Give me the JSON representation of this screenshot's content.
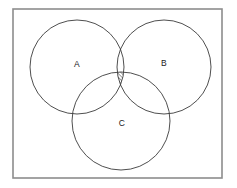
{
  "figure": {
    "background_color": "#ffffff",
    "frame": {
      "name": "universal-set-frame",
      "x": 13,
      "y": 9,
      "width": 209,
      "height": 169,
      "stroke_color": "#8d8d8d",
      "stroke_width": 1.6
    },
    "circle_stroke_color": "#3b3b3b",
    "circle_stroke_width": 0.9,
    "sets": [
      {
        "id": "A",
        "label": "A",
        "cx": 77,
        "cy": 67,
        "r": 47,
        "label_x": 77,
        "label_y": 65
      },
      {
        "id": "B",
        "label": "B",
        "cx": 164,
        "cy": 67,
        "r": 47,
        "label_x": 164,
        "label_y": 64
      },
      {
        "id": "C",
        "label": "C",
        "cx": 121,
        "cy": 121,
        "r": 49,
        "label_x": 122,
        "label_y": 124
      }
    ],
    "shaded_region": {
      "name": "triple-intersection",
      "description": "A intersect B intersect C",
      "fill_pattern": "diagonal-hatch",
      "hatch_direction": "lower-left-to-upper-right",
      "hatch_spacing": 2.6,
      "hatch_color": "#2b2b2b",
      "outline_color": "#2b2b2b"
    }
  },
  "labels": {
    "a": "A",
    "b": "B",
    "c": "C"
  }
}
